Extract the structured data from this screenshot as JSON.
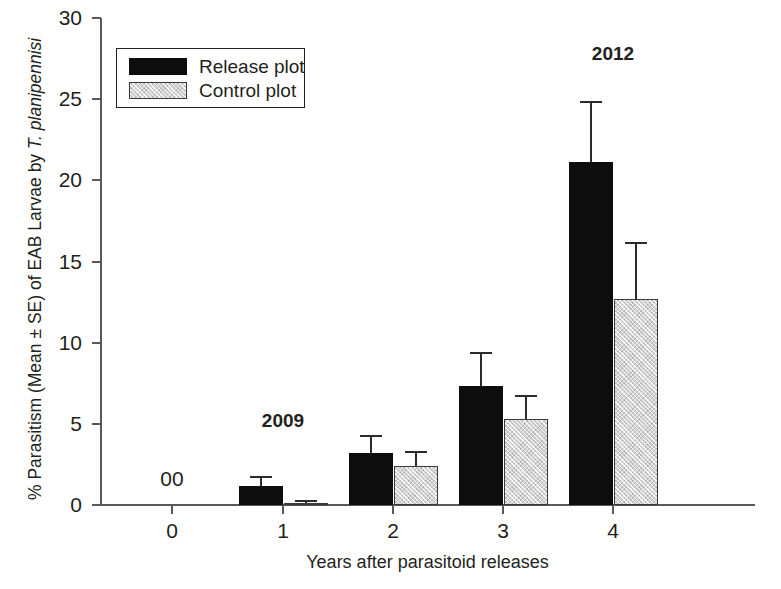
{
  "chart_data": {
    "type": "bar",
    "title": "",
    "xlabel": "Years after parasitoid releases",
    "ylabel": "% Parasitism (Mean ± SE) of EAB Larvae by T. planipennisi",
    "ylabel_plain_prefix": "% Parasitism (Mean ± SE) of EAB Larvae by ",
    "ylabel_italic_suffix": "T. planipennisi",
    "categories": [
      "0",
      "1",
      "2",
      "3",
      "4"
    ],
    "xlim": [
      -0.5,
      4.5
    ],
    "ylim": [
      0,
      30
    ],
    "yticks": [
      0,
      5,
      10,
      15,
      20,
      25,
      30
    ],
    "xticks": [
      0,
      1,
      2,
      3,
      4
    ],
    "grid": false,
    "legend_position": "upper-left",
    "series": [
      {
        "name": "Release plot",
        "color": "#0d0d0d",
        "values": [
          0,
          1.2,
          3.2,
          7.3,
          21.1
        ],
        "errors": [
          0,
          0.6,
          1.1,
          2.1,
          3.8
        ]
      },
      {
        "name": "Control plot",
        "color": "#d4d4d4",
        "values": [
          0,
          0.15,
          2.4,
          5.3,
          12.7
        ],
        "errors": [
          0,
          0.15,
          0.9,
          1.5,
          3.5
        ]
      }
    ],
    "annotations": [
      {
        "text": "2009",
        "category_index": 1,
        "value": 4.6,
        "bold": true
      },
      {
        "text": "2012",
        "category_index": 4,
        "value": 27.2,
        "bold": true
      },
      {
        "text": "00",
        "category_index": 0,
        "value": 1.1,
        "bold": false
      }
    ]
  },
  "legend": {
    "items": [
      {
        "label": "Release plot",
        "swatch": "release-swatch"
      },
      {
        "label": "Control plot",
        "swatch": "control-swatch"
      }
    ]
  },
  "axes": {
    "y_tick_labels": [
      "0",
      "5",
      "10",
      "15",
      "20",
      "25",
      "30"
    ],
    "x_tick_labels": [
      "0",
      "1",
      "2",
      "3",
      "4"
    ]
  }
}
